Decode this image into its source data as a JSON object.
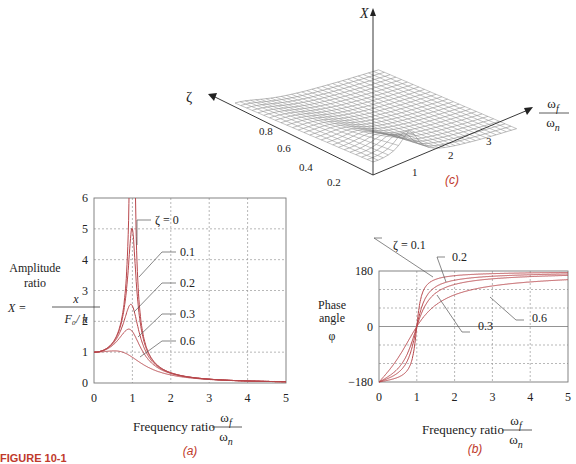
{
  "figure_label": "FIGURE 10-1",
  "chart_data": [
    {
      "id": "a",
      "type": "line",
      "caption": "(a)",
      "title": "",
      "xlabel": "Frequency ratio",
      "xlabel_fraction": {
        "num": "ω_f",
        "den": "ω_n"
      },
      "ylabel": [
        "Amplitude",
        "ratio"
      ],
      "ylabel_formula": {
        "lhs": "X =",
        "num": "x",
        "den": "F_0/ k"
      },
      "xlim": [
        0,
        5
      ],
      "ylim": [
        0,
        6
      ],
      "xticks": [
        0,
        1,
        2,
        3,
        4,
        5
      ],
      "yticks": [
        0,
        1,
        2,
        3,
        4,
        5,
        6
      ],
      "grid": true,
      "series": [
        {
          "name": "ζ = 0",
          "zeta": 0
        },
        {
          "name": "0.1",
          "zeta": 0.1,
          "peak": 5.0
        },
        {
          "name": "0.2",
          "zeta": 0.2,
          "peak": 2.55
        },
        {
          "name": "0.3",
          "zeta": 0.3,
          "peak": 1.75
        },
        {
          "name": "0.6",
          "zeta": 0.6,
          "peak": 1.04
        }
      ]
    },
    {
      "id": "b",
      "type": "line",
      "caption": "(b)",
      "xlabel": "Frequency ratio",
      "xlabel_fraction": {
        "num": "ω_f",
        "den": "ω_n"
      },
      "ylabel": [
        "Phase",
        "angle",
        "φ"
      ],
      "xlim": [
        0,
        5
      ],
      "ylim": [
        -180,
        180
      ],
      "xticks": [
        0,
        1,
        2,
        3,
        4,
        5
      ],
      "yticks": [
        -180,
        0,
        180
      ],
      "grid": true,
      "series": [
        {
          "name": "ζ = 0.1",
          "zeta": 0.1
        },
        {
          "name": "0.2",
          "zeta": 0.2
        },
        {
          "name": "0.3",
          "zeta": 0.3
        },
        {
          "name": "0.6",
          "zeta": 0.6
        }
      ]
    },
    {
      "id": "c",
      "type": "surface",
      "caption": "(c)",
      "zlabel": "X",
      "ylabel": "ζ",
      "xlabel_fraction": {
        "num": "ω_f",
        "den": "ω_n"
      },
      "yticks": [
        0.2,
        0.4,
        0.6,
        0.8
      ],
      "xticks": [
        1,
        2,
        3
      ]
    }
  ]
}
